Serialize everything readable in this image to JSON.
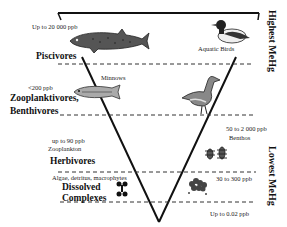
{
  "diagram": {
    "type": "inverted-pyramid",
    "side_labels": {
      "top": "Highest MeHg",
      "bottom": "Lowest MeHg"
    },
    "levels": [
      {
        "name": "Piscivores",
        "concentration": "Up to 20 000 ppb",
        "right_organism": "Aquatic Birds",
        "left_icon": "trout-fish-icon",
        "right_icon": "duck-icon"
      },
      {
        "name": "Zooplanktivores, Benthivores",
        "name_line1": "Zooplanktivores,",
        "name_line2": "Benthivores",
        "concentration": "<200 ppb",
        "left_organism": "Minnows",
        "left_icon": "minnow-fish-icon",
        "right_icon": "wading-bird-icon"
      },
      {
        "name": "Herbivores",
        "concentration": "up to 90 ppb",
        "left_organism": "Zooplankton",
        "right_concentration": "50 to 2 000 ppb",
        "right_organism": "Benthos",
        "right_icon": "benthos-insect-icon"
      },
      {
        "name": "Dissolved Complexes",
        "name_line1": "Dissolved",
        "name_line2": "Complexes",
        "left_organism": "Algae, detritus, macrophytes",
        "right_concentration": "30 to 300 ppb",
        "bottom_concentration": "Up to 0.02 ppb",
        "left_icon": "molecule-icon",
        "right_icon": "algae-icon"
      }
    ]
  }
}
